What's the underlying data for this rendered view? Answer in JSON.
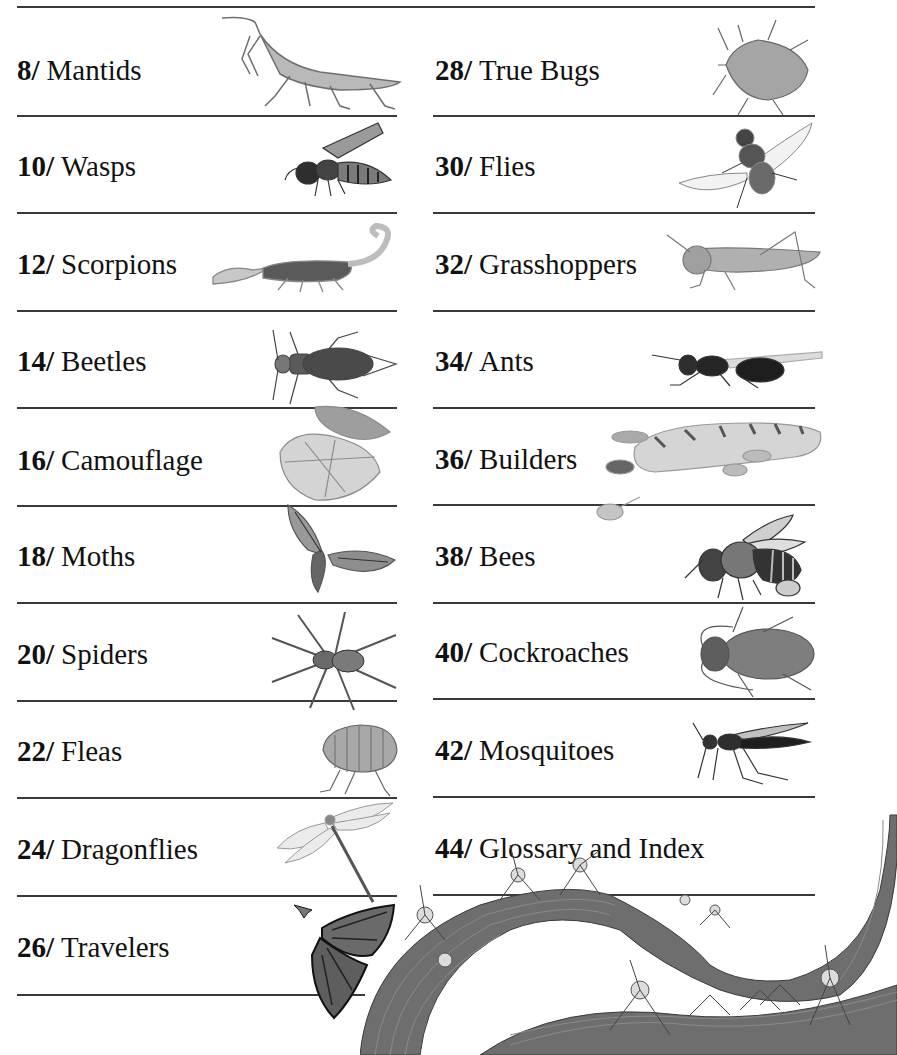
{
  "contents": {
    "left_column": [
      {
        "page": "8",
        "title": "Mantids",
        "icon": "mantis-illustration"
      },
      {
        "page": "10",
        "title": "Wasps",
        "icon": "wasp-illustration"
      },
      {
        "page": "12",
        "title": "Scorpions",
        "icon": "scorpion-illustration"
      },
      {
        "page": "14",
        "title": "Beetles",
        "icon": "beetle-illustration"
      },
      {
        "page": "16",
        "title": "Camouflage",
        "icon": "leaf-insect-illustration"
      },
      {
        "page": "18",
        "title": "Moths",
        "icon": "moth-illustration"
      },
      {
        "page": "20",
        "title": "Spiders",
        "icon": "spider-illustration"
      },
      {
        "page": "22",
        "title": "Fleas",
        "icon": "flea-illustration"
      },
      {
        "page": "24",
        "title": "Dragonflies",
        "icon": "dragonfly-illustration"
      },
      {
        "page": "26",
        "title": "Travelers",
        "icon": "monarch-butterfly-illustration"
      }
    ],
    "right_column": [
      {
        "page": "28",
        "title": "True Bugs",
        "icon": "stink-bug-illustration"
      },
      {
        "page": "30",
        "title": "Flies",
        "icon": "fly-illustration"
      },
      {
        "page": "32",
        "title": "Grasshoppers",
        "icon": "grasshopper-illustration"
      },
      {
        "page": "34",
        "title": "Ants",
        "icon": "winged-ant-illustration"
      },
      {
        "page": "36",
        "title": "Builders",
        "icon": "termite-queen-illustration"
      },
      {
        "page": "38",
        "title": "Bees",
        "icon": "bee-illustration"
      },
      {
        "page": "40",
        "title": "Cockroaches",
        "icon": "cockroach-illustration"
      },
      {
        "page": "42",
        "title": "Mosquitoes",
        "icon": "mosquito-illustration"
      },
      {
        "page": "44",
        "title": "Glossary and Index",
        "icon": "army-ants-vine-illustration"
      }
    ]
  },
  "colors": {
    "rule": "#3a3a3a",
    "text": "#111111",
    "illustration": "#777777"
  }
}
